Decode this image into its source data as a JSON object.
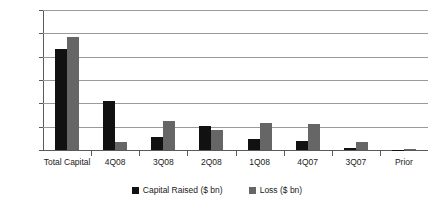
{
  "chart_data": {
    "type": "bar",
    "title": "",
    "subtitle": "",
    "xlabel": "",
    "ylabel": "",
    "ylim": [
      0,
      1200
    ],
    "ytick_step": 200,
    "ytick_labels": [
      "0.0",
      "200.0",
      "400.0",
      "600.0",
      "800.0",
      "1,000.0",
      "1,200.0"
    ],
    "ytick_values": [
      0,
      200,
      400,
      600,
      800,
      1000,
      1200
    ],
    "grid": true,
    "legend_position": "bottom-center",
    "categories": [
      "Total Capital",
      "4Q08",
      "3Q08",
      "2Q08",
      "1Q08",
      "4Q07",
      "3Q07",
      "Prior"
    ],
    "series": [
      {
        "name": "Capital Raised ($ bn)",
        "color": "#111111",
        "values": [
          870,
          420,
          115,
          205,
          95,
          80,
          20,
          3
        ]
      },
      {
        "name": "Loss ($ bn)",
        "color": "#666666",
        "values": [
          970,
          65,
          250,
          175,
          230,
          225,
          70,
          10
        ]
      }
    ]
  },
  "colors": {
    "capital_raised": "#111111",
    "loss": "#666666",
    "gridline": "#9a9a9a",
    "axis": "#5a5a5a",
    "background": "#ffffff",
    "text": "#1a1a1a"
  }
}
